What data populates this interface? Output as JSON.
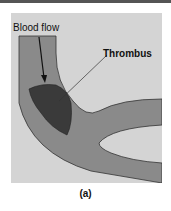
{
  "figure": {
    "labels": {
      "blood_flow": "Blood flow",
      "thrombus": "Thrombus"
    },
    "caption": "(a)",
    "colors": {
      "background": "#d4d4d4",
      "vessel": "#8a8a8a",
      "thrombus": "#3a3a3a",
      "outline": "#333333"
    }
  }
}
